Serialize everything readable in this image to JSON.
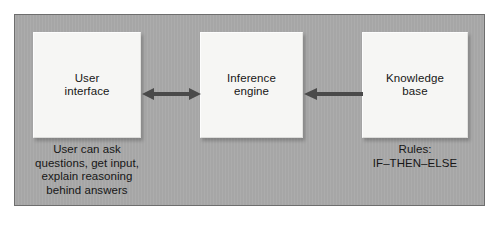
{
  "diagram": {
    "type": "block-diagram",
    "frame": {
      "border_color": "#6e6e6e",
      "background_color": "#a9a9a9",
      "page_background_color": "#ffffff"
    },
    "node_style": {
      "fill_color": "#f6f6f4",
      "text_color": "#161616"
    },
    "arrow_color": "#4a4a4a",
    "nodes": [
      {
        "id": "user-interface",
        "label": "User\ninterface",
        "caption": "User can ask\nquestions, get input,\nexplain reasoning\nbehind answers"
      },
      {
        "id": "inference-engine",
        "label": "Inference\nengine",
        "caption": ""
      },
      {
        "id": "knowledge-base",
        "label": "Knowledge\nbase",
        "caption": "Rules:\nIF–THEN–ELSE"
      }
    ],
    "arrows": [
      {
        "id": "arrow-ui-inference",
        "from": "user-interface",
        "to": "inference-engine",
        "direction": "bidirectional",
        "label": ""
      },
      {
        "id": "arrow-kb-inference",
        "from": "knowledge-base",
        "to": "inference-engine",
        "direction": "left",
        "label": ""
      }
    ]
  }
}
